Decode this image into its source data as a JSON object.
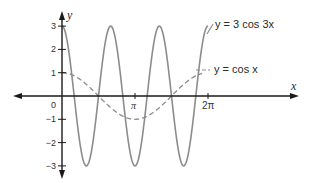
{
  "chart_data": {
    "type": "line",
    "title": "",
    "xlabel": "x",
    "ylabel": "y",
    "xlim": [
      -0.7,
      7.6
    ],
    "ylim": [
      -3.3,
      3.3
    ],
    "grid": false,
    "x_ticks": [
      {
        "value": 0,
        "label": "0"
      },
      {
        "value": 3.14159,
        "label": "π"
      },
      {
        "value": 6.28318,
        "label": "2π"
      }
    ],
    "y_ticks": [
      {
        "value": 3,
        "label": "3"
      },
      {
        "value": 2,
        "label": "2"
      },
      {
        "value": 1,
        "label": "1"
      },
      {
        "value": -1,
        "label": "−1"
      },
      {
        "value": -2,
        "label": "−2"
      },
      {
        "value": -3,
        "label": "−3"
      }
    ],
    "series": [
      {
        "name": "y = 3 cos 3x",
        "style": "solid",
        "color": "#8a8a8a",
        "function": "3*cos(3x)",
        "domain": [
          0,
          6.28318
        ]
      },
      {
        "name": "y = cos x",
        "style": "dashed",
        "color": "#8a8a8a",
        "function": "cos(x)",
        "domain": [
          0,
          6.28318
        ]
      }
    ],
    "annotations": [
      {
        "text": "y = 3 cos 3x",
        "target_series": 0
      },
      {
        "text": "y = cos x",
        "target_series": 1
      }
    ]
  },
  "labels": {
    "x_axis": "x",
    "y_axis": "y",
    "origin": "0",
    "pi": "π",
    "two_pi": "2π",
    "series1_label": "y = 3 cos 3x",
    "series2_label": "y = cos x"
  }
}
